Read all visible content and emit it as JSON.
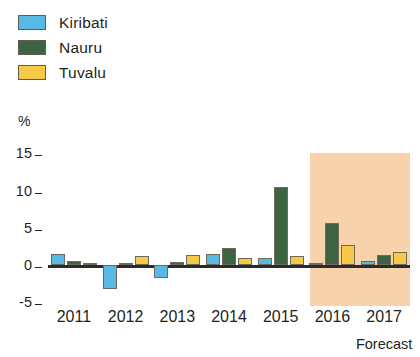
{
  "chart_data": {
    "type": "bar",
    "title": "",
    "subtitle": "",
    "xlabel": "",
    "ylabel": "%",
    "ylim": [
      -5,
      15
    ],
    "yticks": [
      15,
      10,
      5,
      0,
      -5
    ],
    "ytick_labels": [
      "15",
      "10",
      "5",
      "0",
      "-5"
    ],
    "grid": false,
    "legend_position": "top-left",
    "categories": [
      "2011",
      "2012",
      "2013",
      "2014",
      "2015",
      "2016",
      "2017"
    ],
    "series": [
      {
        "name": "Kiribati",
        "color": "#57b9e4",
        "values": [
          1.5,
          -3.2,
          -1.8,
          1.5,
          0.9,
          0.1,
          0.5
        ]
      },
      {
        "name": "Nauru",
        "color": "#3d6340",
        "values": [
          0.5,
          0.1,
          0.4,
          2.3,
          10.5,
          5.7,
          1.3
        ]
      },
      {
        "name": "Tuvalu",
        "color": "#f7c948",
        "values": [
          0.3,
          1.2,
          1.3,
          1.0,
          1.2,
          2.7,
          1.8
        ]
      }
    ],
    "annotations": [
      {
        "text": "Forecast",
        "x_start": "2016",
        "x_end": "2017",
        "type": "shaded-region",
        "color": "#f7d2ab"
      }
    ]
  },
  "legend": {
    "items": [
      {
        "label": "Kiribati",
        "color": "#57b9e4"
      },
      {
        "label": "Nauru",
        "color": "#3d6340"
      },
      {
        "label": "Tuvalu",
        "color": "#f7c948"
      }
    ]
  },
  "axis": {
    "unit_label": "%",
    "y_ticks": [
      "15",
      "10",
      "5",
      "0",
      "-5"
    ],
    "x_ticks": [
      "2011",
      "2012",
      "2013",
      "2014",
      "2015",
      "2016",
      "2017"
    ]
  },
  "forecast": {
    "label": "Forecast"
  }
}
